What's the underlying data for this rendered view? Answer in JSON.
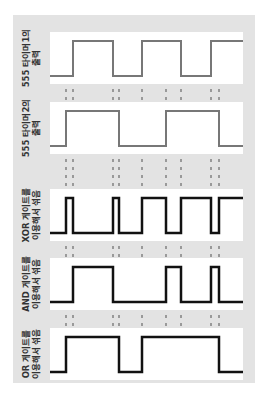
{
  "diagram": {
    "title": "",
    "background": "#e3e3e3",
    "panel_color": "#ffffff",
    "panels": [
      {
        "id": "timer1",
        "label_line1": "555 타이머1의",
        "label_line2": "출력",
        "stroke": "#777777",
        "stroke_width": 2,
        "transitions_x": [
          73,
          113,
          142,
          181,
          211
        ],
        "start_level": "low"
      },
      {
        "id": "timer2",
        "label_line1": "555 타이머2의",
        "label_line2": "출력",
        "stroke": "#777777",
        "stroke_width": 2,
        "transitions_x": [
          66,
          119,
          166,
          219
        ],
        "start_level": "low"
      },
      {
        "id": "xor",
        "label_line1": "XOR 게이트를",
        "label_line2": "이용해서 섞음",
        "stroke": "#111111",
        "stroke_width": 2.5,
        "transitions_x": [
          66,
          73,
          113,
          119,
          142,
          166,
          181,
          211,
          219
        ],
        "start_level": "low"
      },
      {
        "id": "and",
        "label_line1": "AND 게이트를",
        "label_line2": "이용해서 섞음",
        "stroke": "#111111",
        "stroke_width": 2.5,
        "transitions_x": [
          73,
          113,
          166,
          181,
          211,
          219
        ],
        "start_level": "low"
      },
      {
        "id": "or",
        "label_line1": "OR 게이트를",
        "label_line2": "이용해서 섞음",
        "stroke": "#111111",
        "stroke_width": 2.5,
        "transitions_x": [
          66,
          119,
          142,
          219
        ],
        "start_level": "low"
      }
    ],
    "guide_lines_x": [
      66,
      73,
      113,
      119,
      142,
      166,
      181,
      211,
      219
    ],
    "guide_color": "#999999"
  }
}
